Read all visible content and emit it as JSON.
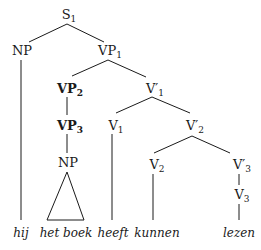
{
  "tree": {
    "nodes": {
      "s1": {
        "cat": "S",
        "sub": "1"
      },
      "np_subj": {
        "cat": "NP",
        "sub": ""
      },
      "vp1": {
        "cat": "VP",
        "sub": "1"
      },
      "vp2": {
        "cat": "VP",
        "sub": "2"
      },
      "vp3": {
        "cat": "VP",
        "sub": "3"
      },
      "np_obj": {
        "cat": "NP",
        "sub": ""
      },
      "vbar1": {
        "cat": "V′",
        "sub": "1"
      },
      "v1": {
        "cat": "V",
        "sub": "1"
      },
      "vbar2": {
        "cat": "V′",
        "sub": "2"
      },
      "v2": {
        "cat": "V",
        "sub": "2"
      },
      "vbar3": {
        "cat": "V′",
        "sub": "3"
      },
      "v3": {
        "cat": "V",
        "sub": "3"
      }
    },
    "words": {
      "hij": "hij",
      "het_boek": "het boek",
      "heeft": "heeft",
      "kunnen": "kunnen",
      "lezen": "lezen"
    }
  }
}
